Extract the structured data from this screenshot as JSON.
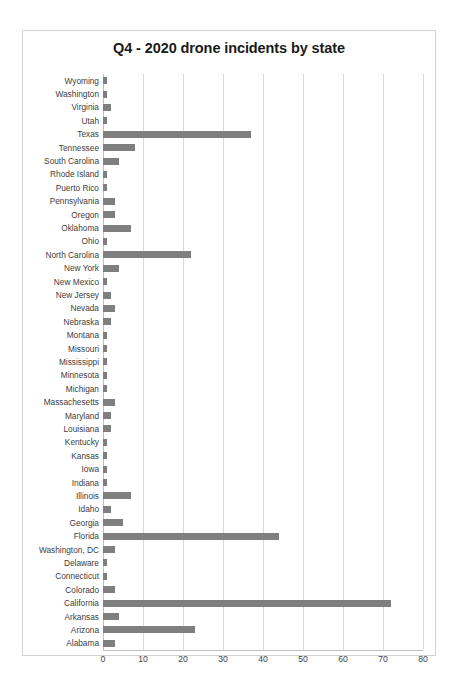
{
  "chart_data": {
    "type": "bar",
    "orientation": "horizontal",
    "title": "Q4 - 2020 drone incidents by state",
    "xlabel": "",
    "ylabel": "",
    "xlim": [
      0,
      80
    ],
    "xticks": [
      0,
      10,
      20,
      30,
      40,
      50,
      60,
      70,
      80
    ],
    "grid": true,
    "legend": false,
    "bar_color": "#7f7f7f",
    "categories": [
      "Wyoming",
      "Washington",
      "Virginia",
      "Utah",
      "Texas",
      "Tennessee",
      "South Carolina",
      "Rhode Island",
      "Puerto Rico",
      "Pennsylvania",
      "Oregon",
      "Oklahoma",
      "Ohio",
      "North Carolina",
      "New York",
      "New Mexico",
      "New Jersey",
      "Nevada",
      "Nebraska",
      "Montana",
      "Missouri",
      "Mississippi",
      "Minnesota",
      "Michigan",
      "Massachesetts",
      "Maryland",
      "Louisiana",
      "Kentucky",
      "Kansas",
      "Iowa",
      "Indiana",
      "Illinois",
      "Idaho",
      "Georgia",
      "Florida",
      "Washington, DC",
      "Delaware",
      "Connecticut",
      "Colorado",
      "California",
      "Arkansas",
      "Arizona",
      "Alabama"
    ],
    "values": [
      1,
      1,
      2,
      1,
      37,
      8,
      4,
      1,
      1,
      3,
      3,
      7,
      1,
      22,
      4,
      1,
      2,
      3,
      2,
      1,
      1,
      1,
      1,
      1,
      3,
      2,
      2,
      1,
      1,
      1,
      1,
      7,
      2,
      5,
      44,
      3,
      1,
      1,
      3,
      72,
      4,
      23,
      3
    ]
  }
}
